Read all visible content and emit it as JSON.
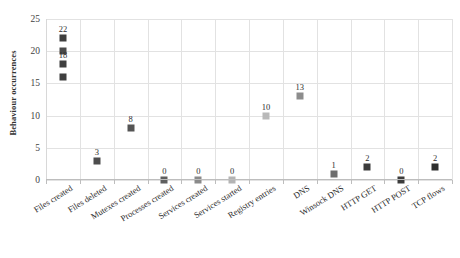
{
  "chart_data": {
    "type": "scatter",
    "title": "",
    "xlabel": "",
    "ylabel": "Behaviour occurrences",
    "ylim": [
      0,
      25
    ],
    "yticks": [
      0,
      5,
      10,
      15,
      20,
      25
    ],
    "grid": true,
    "legend": false,
    "categories": [
      "Files created",
      "Files deleted",
      "Mutexes created",
      "Processes created",
      "Services created",
      "Services started",
      "Registry entries",
      "DNS",
      "Winsock DNS",
      "HTTP GET",
      "HTTP POST",
      "TCP flows"
    ],
    "points": [
      {
        "category": "Files created",
        "value": 22,
        "label": "22",
        "show_label": true,
        "color": "#3f3f3f"
      },
      {
        "category": "Files created",
        "value": 20,
        "label": "20",
        "show_label": false,
        "color": "#4a4a4a"
      },
      {
        "category": "Files created",
        "value": 18,
        "label": "18",
        "show_label": true,
        "color": "#3f3f3f"
      },
      {
        "category": "Files created",
        "value": 16,
        "label": "16",
        "show_label": false,
        "color": "#3f3f3f"
      },
      {
        "category": "Files deleted",
        "value": 3,
        "label": "3",
        "show_label": true,
        "color": "#4d4d4d"
      },
      {
        "category": "Mutexes created",
        "value": 8,
        "label": "8",
        "show_label": true,
        "color": "#545454"
      },
      {
        "category": "Processes created",
        "value": 0,
        "label": "0",
        "show_label": true,
        "color": "#5f5f5f"
      },
      {
        "category": "Services created",
        "value": 0,
        "label": "0",
        "show_label": true,
        "color": "#8a8a8a"
      },
      {
        "category": "Services started",
        "value": 0,
        "label": "0",
        "show_label": true,
        "color": "#b4b4b4"
      },
      {
        "category": "Registry entries",
        "value": 10,
        "label": "10",
        "show_label": true,
        "color": "#b9b9b9"
      },
      {
        "category": "DNS",
        "value": 13,
        "label": "13",
        "show_label": true,
        "color": "#8d8d8d"
      },
      {
        "category": "Winsock DNS",
        "value": 1,
        "label": "1",
        "show_label": true,
        "color": "#6e6e6e"
      },
      {
        "category": "HTTP GET",
        "value": 2,
        "label": "2",
        "show_label": true,
        "color": "#3c3c3c"
      },
      {
        "category": "HTTP POST",
        "value": 0,
        "label": "0",
        "show_label": true,
        "color": "#3c3c3c"
      },
      {
        "category": "TCP flows",
        "value": 2,
        "label": "2",
        "show_label": true,
        "color": "#2f2f2f"
      }
    ]
  },
  "colors": {
    "grid": "#e2e2e2",
    "axis": "#bdbdbd",
    "text": "#2e2e2e",
    "background": "#ffffff"
  }
}
